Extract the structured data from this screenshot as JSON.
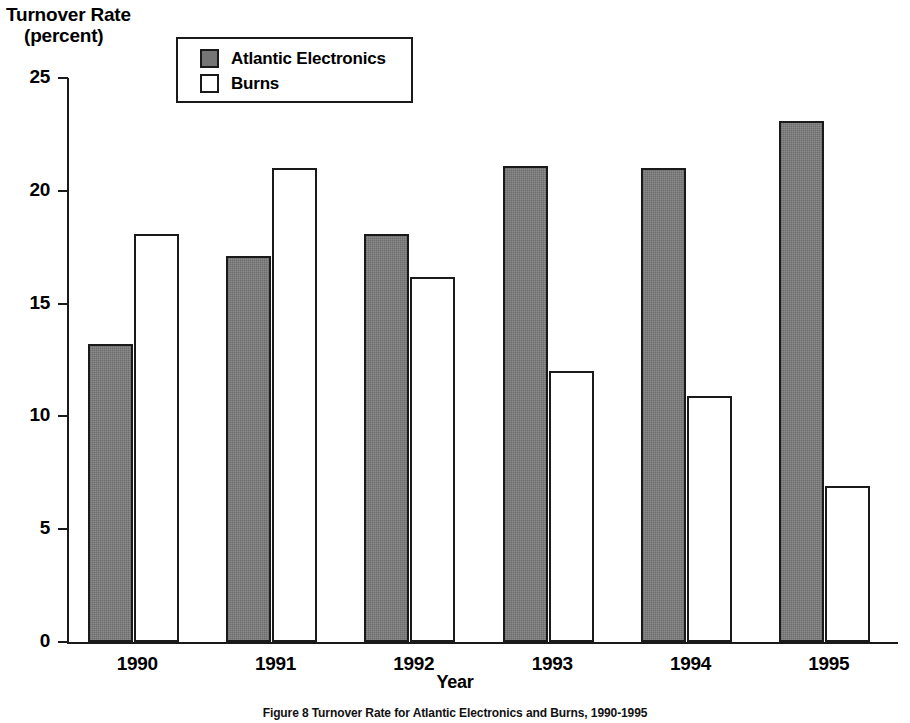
{
  "chart_data": {
    "type": "bar",
    "title": "Turnover Rate (percent)",
    "title_line1": "Turnover Rate",
    "title_line2": "(percent)",
    "xlabel": "Year",
    "ylabel": "Turnover Rate (percent)",
    "categories": [
      "1990",
      "1991",
      "1992",
      "1993",
      "1994",
      "1995"
    ],
    "series": [
      {
        "name": "Atlantic Electronics",
        "color": "#757575",
        "values": [
          13.2,
          17.1,
          18.1,
          21.1,
          21.0,
          23.1
        ]
      },
      {
        "name": "Burns",
        "color": "#ffffff",
        "values": [
          18.1,
          21.0,
          16.2,
          12.0,
          10.9,
          6.9
        ]
      }
    ],
    "ylim": [
      0,
      25
    ],
    "ytick_values": [
      0,
      5,
      10,
      15,
      20,
      25
    ],
    "ytick_labels": [
      "0",
      "5",
      "10",
      "15",
      "20",
      "25"
    ],
    "grid": false,
    "legend_position": "top-left-inside",
    "caption": "Figure 8  Turnover Rate for Atlantic Electronics and Burns, 1990-1995"
  },
  "legend": {
    "entries": [
      {
        "label": "Atlantic Electronics",
        "swatch": "filled"
      },
      {
        "label": "Burns",
        "swatch": "hollow"
      }
    ]
  }
}
